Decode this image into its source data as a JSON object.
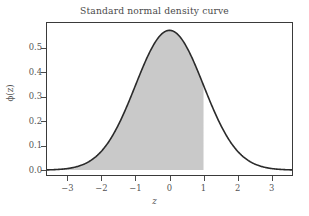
{
  "chart_data": {
    "type": "line",
    "title": "Standard normal density curve",
    "xlabel": "z",
    "ylabel": "ϕ(z)",
    "xlim": [
      -3.6,
      3.6
    ],
    "ylim": [
      -0.02,
      0.6
    ],
    "grid": false,
    "legend": null,
    "xticks": [
      -3,
      -2,
      -1,
      0,
      1,
      2,
      3
    ],
    "xtick_labels": [
      "−3",
      "−2",
      "−1",
      "0",
      "1",
      "2",
      "3"
    ],
    "yticks": [
      0.0,
      0.1,
      0.2,
      0.3,
      0.4,
      0.5
    ],
    "ytick_labels": [
      "0.0",
      "0.1",
      "0.2",
      "0.3",
      "0.4",
      "0.5"
    ],
    "curve_color": "#2b2b2b",
    "curve_width": 1.6,
    "fill_color": "#c9c9c9",
    "frame_color": "#3a3a3a",
    "background": "#ffffff",
    "peak_value": 0.57,
    "peak_x": 0,
    "shaded_region": {
      "from": -3.6,
      "to": 1.0,
      "label": "area under curve left of z = 1"
    },
    "series": [
      {
        "name": "standard normal density",
        "x": [
          -3.6,
          -3.4,
          -3.2,
          -3.0,
          -2.8,
          -2.6,
          -2.4,
          -2.2,
          -2.0,
          -1.8,
          -1.6,
          -1.4,
          -1.2,
          -1.0,
          -0.8,
          -0.6,
          -0.4,
          -0.2,
          0.0,
          0.2,
          0.4,
          0.6,
          0.8,
          1.0,
          1.2,
          1.4,
          1.6,
          1.8,
          2.0,
          2.2,
          2.4,
          2.6,
          2.8,
          3.0,
          3.2,
          3.4,
          3.6
        ],
        "y": [
          0.0009,
          0.0017,
          0.0033,
          0.0063,
          0.0113,
          0.0195,
          0.032,
          0.0506,
          0.077,
          0.1127,
          0.1585,
          0.2144,
          0.2789,
          0.3457,
          0.4136,
          0.472,
          0.5198,
          0.5507,
          0.57,
          0.5507,
          0.5198,
          0.472,
          0.4136,
          0.3457,
          0.2789,
          0.2144,
          0.1585,
          0.1127,
          0.077,
          0.0506,
          0.032,
          0.0195,
          0.0113,
          0.0063,
          0.0033,
          0.0017,
          0.0009
        ]
      }
    ]
  },
  "figure": {
    "title": "Standard normal density curve",
    "xaxis_label": "z",
    "yaxis_label": "ϕ(z)"
  }
}
